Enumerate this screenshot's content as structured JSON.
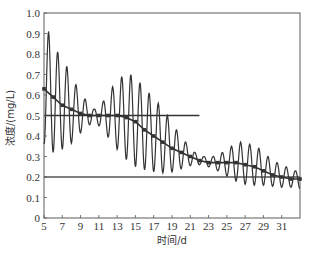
{
  "chart_data": {
    "type": "line",
    "title": "",
    "xlabel": "时间/d",
    "ylabel": "浓度/(mg/L)",
    "xlim": [
      5,
      33
    ],
    "ylim": [
      0,
      1.0
    ],
    "x_ticks": [
      5,
      7,
      9,
      11,
      13,
      15,
      17,
      19,
      21,
      23,
      25,
      27,
      29,
      31
    ],
    "y_ticks": [
      0,
      0.1,
      0.2,
      0.3,
      0.4,
      0.5,
      0.6,
      0.7,
      0.8,
      0.9,
      1.0
    ],
    "y_tick_labels": [
      "0",
      "0.1",
      "0.2",
      "0.3",
      "0.4",
      "0.5",
      "0.6",
      "0.7",
      "0.8",
      "0.9",
      "1.0"
    ],
    "grid": false,
    "legend": null,
    "series": [
      {
        "name": "oscillating concentration",
        "style": "line",
        "color": "#333333",
        "description": "Daily oscillation (period ~1 d) around a trend; amplitude large early (peak 0.93 at day 5.5), shrinking to ~0.02 near day 10, growing again to ~0.2 near days 13-16, shrinking near days 21-23, growing again near days 25-28, then decaying",
        "envelope": {
          "x": [
            5.0,
            5.5,
            6.5,
            7.5,
            8.5,
            9.5,
            10.5,
            11.5,
            12.5,
            13.5,
            14.5,
            15.5,
            16.5,
            17.5,
            18.5,
            19.5,
            20.5,
            21.5,
            22.5,
            23.5,
            24.5,
            25.5,
            26.5,
            27.5,
            28.5,
            29.5,
            30.5,
            31.5,
            32.5,
            33.0
          ],
          "center": [
            0.63,
            0.61,
            0.57,
            0.54,
            0.52,
            0.51,
            0.5,
            0.5,
            0.5,
            0.5,
            0.48,
            0.45,
            0.42,
            0.39,
            0.36,
            0.33,
            0.31,
            0.29,
            0.28,
            0.27,
            0.27,
            0.27,
            0.27,
            0.26,
            0.25,
            0.23,
            0.21,
            0.2,
            0.19,
            0.19
          ],
          "amplitude": [
            0.27,
            0.3,
            0.24,
            0.2,
            0.13,
            0.07,
            0.03,
            0.07,
            0.14,
            0.19,
            0.22,
            0.21,
            0.19,
            0.17,
            0.14,
            0.1,
            0.06,
            0.03,
            0.02,
            0.03,
            0.05,
            0.08,
            0.1,
            0.1,
            0.09,
            0.07,
            0.06,
            0.05,
            0.04,
            0.05
          ]
        }
      },
      {
        "name": "trend (marked)",
        "style": "line-markers",
        "color": "#333333",
        "x": [
          5,
          6,
          7,
          8,
          9,
          10,
          11,
          12,
          13,
          14,
          15,
          16,
          17,
          18,
          19,
          20,
          21,
          22,
          23,
          24,
          25,
          26,
          27,
          28,
          29,
          30,
          31,
          32,
          33
        ],
        "y": [
          0.63,
          0.59,
          0.55,
          0.53,
          0.51,
          0.5,
          0.5,
          0.5,
          0.5,
          0.49,
          0.47,
          0.43,
          0.4,
          0.37,
          0.34,
          0.32,
          0.3,
          0.28,
          0.27,
          0.27,
          0.27,
          0.27,
          0.26,
          0.25,
          0.23,
          0.21,
          0.2,
          0.19,
          0.19
        ]
      },
      {
        "name": "reference 0.5",
        "style": "hline",
        "color": "#333333",
        "x": [
          5,
          22
        ],
        "y": [
          0.5,
          0.5
        ]
      },
      {
        "name": "reference 0.2",
        "style": "hline",
        "color": "#555555",
        "x": [
          5,
          33
        ],
        "y": [
          0.2,
          0.2
        ]
      }
    ]
  },
  "axes": {
    "xlabel": "时间/d",
    "ylabel": "浓度/(mg/L)"
  }
}
